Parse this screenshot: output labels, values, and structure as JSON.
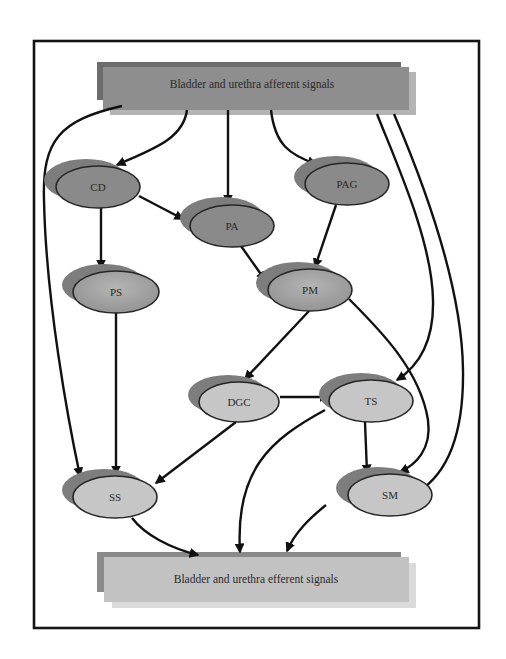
{
  "diagram": {
    "type": "flow-diagram",
    "boxes": {
      "top": {
        "label": "Bladder and urethra afferent signals"
      },
      "bottom": {
        "label": "Bladder and urethra efferent signals"
      }
    },
    "nodes": [
      {
        "id": "CD",
        "label": "CD",
        "shade": "dark"
      },
      {
        "id": "PA",
        "label": "PA",
        "shade": "dark"
      },
      {
        "id": "PAG",
        "label": "PAG",
        "shade": "dark"
      },
      {
        "id": "PS",
        "label": "PS",
        "shade": "medium"
      },
      {
        "id": "PM",
        "label": "PM",
        "shade": "medium"
      },
      {
        "id": "DGC",
        "label": "DGC",
        "shade": "light"
      },
      {
        "id": "TS",
        "label": "TS",
        "shade": "light"
      },
      {
        "id": "SS",
        "label": "SS",
        "shade": "light"
      },
      {
        "id": "SM",
        "label": "SM",
        "shade": "light"
      }
    ],
    "edges": [
      {
        "from": "afferent",
        "to": "CD"
      },
      {
        "from": "afferent",
        "to": "PA"
      },
      {
        "from": "afferent",
        "to": "PAG"
      },
      {
        "from": "afferent",
        "to": "SS"
      },
      {
        "from": "afferent",
        "to": "TS"
      },
      {
        "from": "afferent",
        "to": "SM"
      },
      {
        "from": "CD",
        "to": "PA"
      },
      {
        "from": "CD",
        "to": "PS"
      },
      {
        "from": "PA",
        "to": "PM"
      },
      {
        "from": "PAG",
        "to": "PM"
      },
      {
        "from": "PS",
        "to": "SS"
      },
      {
        "from": "PM",
        "to": "DGC"
      },
      {
        "from": "PM",
        "to": "SM"
      },
      {
        "from": "DGC",
        "to": "TS"
      },
      {
        "from": "DGC",
        "to": "SS"
      },
      {
        "from": "TS",
        "to": "SM"
      },
      {
        "from": "TS",
        "to": "efferent"
      },
      {
        "from": "SS",
        "to": "efferent"
      },
      {
        "from": "SM",
        "to": "efferent"
      }
    ],
    "colors": {
      "box_top_main": "#8e8e8e",
      "box_top_shadow_dark": "#6c6c6c",
      "box_top_shadow_light": "#b4b4b4",
      "box_bottom_main": "#c2c2c2",
      "box_bottom_shadow_dark": "#8a8a8a",
      "box_bottom_shadow_light": "#dadada",
      "node_dark": "#8a8a8a",
      "node_medium": "#a4a4a4",
      "node_light": "#c6c6c6",
      "node_shadow": "#7d7d7d",
      "edge": "#111111",
      "frame": "#141414"
    }
  }
}
